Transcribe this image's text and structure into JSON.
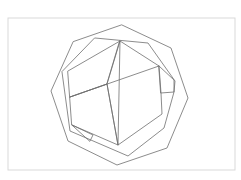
{
  "diagram": {
    "type": "geometric-line-drawing",
    "background": "#ffffff",
    "line_color": "#6e6e6e",
    "frame": {
      "x": 8,
      "y": 18,
      "width": 227,
      "height": 152,
      "stroke": "#d9d9d9"
    },
    "polygons": [
      {
        "name": "outer-octagon",
        "points": "122,25 171,48 188,98 167,148 117,165 68,141 51,91 73,42"
      },
      {
        "name": "middle-polygon",
        "points": "95,38 148,43 175,81 174,92 164,128 128,156 70,131 62,72"
      },
      {
        "name": "inner-front-left-face",
        "points": "68,71 120,41 107,84 70,97"
      },
      {
        "name": "inner-front-right-face",
        "points": "120,41 159,66 161,93 162,114 118,145 107,84"
      },
      {
        "name": "inner-bottom-left-face",
        "points": "70,97 107,84 118,145 72,125"
      },
      {
        "name": "inner-right-tab",
        "points": "159,66 174,80 174,92 161,93"
      },
      {
        "name": "inner-bottom-tab",
        "points": "72,125 93,135 90,141"
      }
    ],
    "segments": [
      {
        "name": "center-diagonal",
        "x1": 70,
        "y1": 97,
        "x2": 159,
        "y2": 66
      },
      {
        "name": "vertical-spine",
        "x1": 120,
        "y1": 41,
        "x2": 118,
        "y2": 145
      }
    ]
  }
}
